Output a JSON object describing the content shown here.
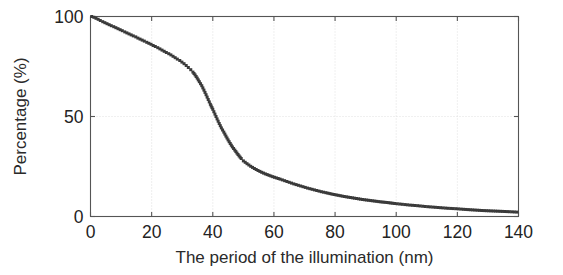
{
  "figure": {
    "background_color": "#ffffff",
    "axis_color": "#555555",
    "grid_color": "#d8d8d8",
    "marker_color": "#3a3a3a"
  },
  "chart_data": {
    "type": "scatter",
    "title": "",
    "xlabel": "The period of the illumination (nm)",
    "ylabel": "Percentage (%)",
    "xlim": [
      0,
      140
    ],
    "ylim": [
      0,
      100
    ],
    "xticks": [
      0,
      20,
      40,
      60,
      80,
      100,
      120,
      140
    ],
    "yticks": [
      0,
      50,
      100
    ],
    "xtick_labels": [
      "0",
      "20",
      "40",
      "60",
      "80",
      "100",
      "120",
      "140"
    ],
    "ytick_labels": [
      "0",
      "50",
      "100"
    ],
    "grid": true,
    "legend": "none",
    "marker": "square",
    "marker_size_px": 3,
    "series": [
      {
        "name": "cumulative percentage",
        "x": [
          0.4,
          1.1,
          1.8,
          2.5,
          3.2,
          4.0,
          4.7,
          5.4,
          6.1,
          6.8,
          7.6,
          8.3,
          9.0,
          9.7,
          10.4,
          11.2,
          11.9,
          12.6,
          13.3,
          14.0,
          14.8,
          15.5,
          16.2,
          16.9,
          17.6,
          18.4,
          19.1,
          19.8,
          20.5,
          21.2,
          22.0,
          22.7,
          23.4,
          24.1,
          24.8,
          25.6,
          26.3,
          27.0,
          27.7,
          28.4,
          29.2,
          29.9,
          30.6,
          31.3,
          32.0,
          32.8,
          33.5,
          34.2,
          34.9,
          35.6,
          36.4,
          37.1,
          37.8,
          38.5,
          39.2,
          40.0,
          40.7,
          41.4,
          42.1,
          42.8,
          43.6,
          44.3,
          45.0,
          45.7,
          46.4,
          47.2,
          47.9,
          48.6,
          49.3,
          50.0,
          51.2,
          52.4,
          53.6,
          54.8,
          56.0,
          57.2,
          58.4,
          59.6,
          60.8,
          62.0,
          63.5,
          65.0,
          66.5,
          68.0,
          69.5,
          71.0,
          72.5,
          74.0,
          75.5,
          77.0,
          79.0,
          81.0,
          83.0,
          85.0,
          87.0,
          89.0,
          91.0,
          93.0,
          95.0,
          97.0,
          99.5,
          102.0,
          104.5,
          107.0,
          109.5,
          112.0,
          114.5,
          117.0,
          119.5,
          122.0,
          125.0,
          128.0,
          131.0,
          134.0,
          137.0,
          139.5
        ],
        "y": [
          100.0,
          99.6,
          99.1,
          98.6,
          98.0,
          97.4,
          96.9,
          96.4,
          95.9,
          95.4,
          94.9,
          94.4,
          93.9,
          93.4,
          92.9,
          92.3,
          91.8,
          91.3,
          90.8,
          90.3,
          89.8,
          89.2,
          88.7,
          88.2,
          87.7,
          87.1,
          86.6,
          86.1,
          85.5,
          85.0,
          84.4,
          83.8,
          83.2,
          82.6,
          82.0,
          81.4,
          80.8,
          80.1,
          79.4,
          78.7,
          78.0,
          77.2,
          76.4,
          75.5,
          74.5,
          73.4,
          72.2,
          70.8,
          69.2,
          67.4,
          65.4,
          63.2,
          60.9,
          58.5,
          56.1,
          53.6,
          51.2,
          48.8,
          46.5,
          44.3,
          42.2,
          40.2,
          38.3,
          36.5,
          34.8,
          33.2,
          31.7,
          30.3,
          29.0,
          27.8,
          26.4,
          25.1,
          24.0,
          23.0,
          22.1,
          21.3,
          20.6,
          19.9,
          19.3,
          18.7,
          17.9,
          17.1,
          16.3,
          15.6,
          14.9,
          14.2,
          13.6,
          13.0,
          12.4,
          11.9,
          11.2,
          10.6,
          10.0,
          9.5,
          9.0,
          8.5,
          8.1,
          7.7,
          7.3,
          7.0,
          6.5,
          6.1,
          5.7,
          5.4,
          5.0,
          4.7,
          4.4,
          4.1,
          3.9,
          3.6,
          3.3,
          3.0,
          2.8,
          2.6,
          2.4,
          2.2
        ]
      }
    ]
  }
}
